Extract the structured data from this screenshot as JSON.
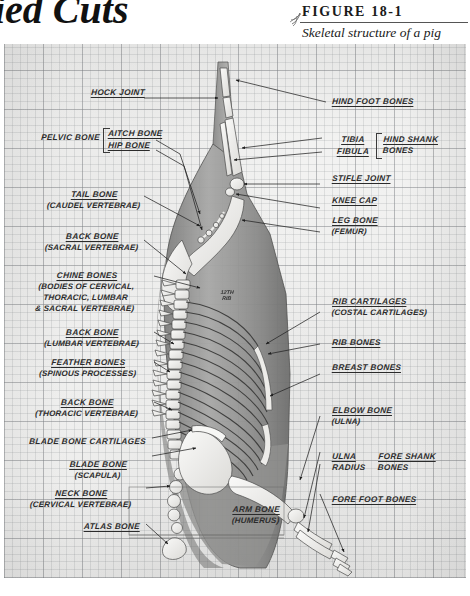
{
  "page": {
    "book_title_partial": "ied Cuts"
  },
  "figure": {
    "ornament_icon": "flourish-ornament-icon",
    "label": "FIGURE 18-1",
    "caption": "Skeletal structure of a pig"
  },
  "illustration": {
    "description": "pencil-drawn side view of a pig carcass showing skeletal structure on graph paper",
    "inline_note": "12TH\nRIB"
  },
  "labels_left": [
    {
      "name": "hock-joint",
      "main": "HOCK JOINT",
      "sub": ""
    },
    {
      "name": "pelvic-bone",
      "main": "PELVIC BONE",
      "sub": ""
    },
    {
      "name": "aitch-bone",
      "main": "AITCH BONE",
      "sub": ""
    },
    {
      "name": "hip-bone",
      "main": "HIP BONE",
      "sub": ""
    },
    {
      "name": "tail-bone",
      "main": "TAIL BONE",
      "sub": "(CAUDEL VERTEBRAE)"
    },
    {
      "name": "back-bone-sacral",
      "main": "BACK BONE",
      "sub": "(SACRAL VERTEBRAE)"
    },
    {
      "name": "chine-bones",
      "main": "CHINE BONES",
      "sub": "(BODIES OF CERVICAL,\nTHORACIC, LUMBAR\n& SACRAL VERTEBRAE)"
    },
    {
      "name": "back-bone-lumbar",
      "main": "BACK BONE",
      "sub": "(LUMBAR VERTEBRAE)"
    },
    {
      "name": "feather-bones",
      "main": "FEATHER BONES",
      "sub": "(SPINOUS PROCESSES)"
    },
    {
      "name": "back-bone-thoracic",
      "main": "BACK BONE",
      "sub": "(THORACIC VERTEBRAE)"
    },
    {
      "name": "blade-bone-cartilages",
      "main": "BLADE BONE CARTILAGES",
      "sub": ""
    },
    {
      "name": "blade-bone",
      "main": "BLADE BONE",
      "sub": "(SCAPULA)"
    },
    {
      "name": "neck-bone",
      "main": "NECK BONE",
      "sub": "(CERVICAL VERTEBRAE)"
    },
    {
      "name": "atlas-bone",
      "main": "ATLAS BONE",
      "sub": ""
    }
  ],
  "labels_right": [
    {
      "name": "hind-foot-bones",
      "main": "HIND FOOT BONES",
      "sub": ""
    },
    {
      "name": "tibia",
      "main": "TIBIA",
      "sub": ""
    },
    {
      "name": "fibula",
      "main": "FIBULA",
      "sub": ""
    },
    {
      "name": "hind-shank-bones",
      "main": "HIND SHANK",
      "sub": "BONES"
    },
    {
      "name": "stifle-joint",
      "main": "STIFLE JOINT",
      "sub": ""
    },
    {
      "name": "knee-cap",
      "main": "KNEE CAP",
      "sub": ""
    },
    {
      "name": "leg-bone",
      "main": "LEG BONE",
      "sub": "(FEMUR)"
    },
    {
      "name": "rib-cartilages",
      "main": "RIB CARTILAGES",
      "sub": "(COSTAL CARTILAGES)"
    },
    {
      "name": "rib-bones",
      "main": "RIB BONES",
      "sub": ""
    },
    {
      "name": "breast-bones",
      "main": "BREAST BONES",
      "sub": ""
    },
    {
      "name": "elbow-bone",
      "main": "ELBOW BONE",
      "sub": "(ULNA)"
    },
    {
      "name": "ulna",
      "main": "ULNA",
      "sub": ""
    },
    {
      "name": "radius",
      "main": "RADIUS",
      "sub": ""
    },
    {
      "name": "fore-shank-bones",
      "main": "FORE SHANK",
      "sub": "BONES"
    },
    {
      "name": "fore-foot-bones",
      "main": "FORE FOOT BONES",
      "sub": ""
    }
  ],
  "labels_center": [
    {
      "name": "arm-bone",
      "main": "ARM BONE",
      "sub": "(HUMERUS)"
    }
  ],
  "colors": {
    "ink": "#2b2b2b",
    "paper": "#f2f2ef",
    "grid_minor": "#8c96a0",
    "grid_major": "#78828c",
    "carcass_grey": "#9a9a98",
    "bone_white": "#f7f6f2"
  }
}
